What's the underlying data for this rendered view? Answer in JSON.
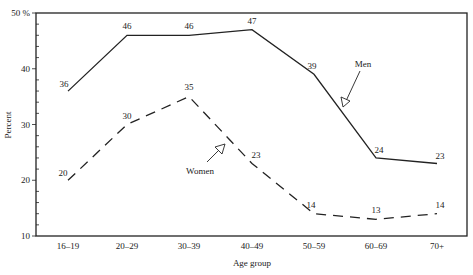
{
  "chart_data": {
    "type": "line",
    "title": "",
    "xlabel": "Age group",
    "ylabel": "Percent",
    "categories": [
      "16–19",
      "20–29",
      "30–39",
      "40–49",
      "50–59",
      "60–69",
      "70+"
    ],
    "series": [
      {
        "name": "Men",
        "style": "solid",
        "values": [
          36,
          46,
          46,
          47,
          39,
          24,
          23
        ]
      },
      {
        "name": "Women",
        "style": "dashed",
        "values": [
          20,
          30,
          35,
          23,
          14,
          13,
          14
        ]
      }
    ],
    "ylim": [
      10,
      50
    ],
    "yticks": [
      10,
      20,
      30,
      40,
      50
    ],
    "ytick_labels": [
      "10",
      "20",
      "30",
      "40",
      "50 %"
    ],
    "grid": false,
    "legend": "inline annotations with arrows",
    "annotations": [
      {
        "text": "Men",
        "points_to": "Men"
      },
      {
        "text": "Women",
        "points_to": "Women"
      }
    ]
  },
  "axes": {
    "x_title": "Age group",
    "y_title": "Percent"
  },
  "colors": {
    "line": "#222222",
    "background": "#ffffff"
  }
}
